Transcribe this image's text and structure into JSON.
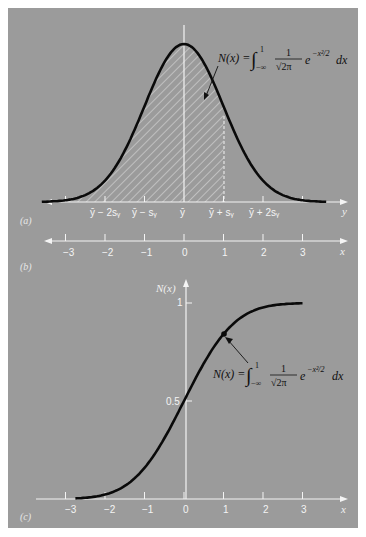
{
  "figure": {
    "background_color": "#9b9b9b",
    "curve_color": "#0a0a0a",
    "axis_color": "#f4f4f4"
  },
  "panels": {
    "a": {
      "label": "(a)",
      "axis_name": "y",
      "tick_labels": [
        "ȳ − 2sᵧ",
        "ȳ − sᵧ",
        "ȳ",
        "ȳ + sᵧ",
        "ȳ + 2sᵧ"
      ],
      "formula": {
        "lhs": "N(x) =",
        "integral": "∫",
        "upper": "1",
        "lower": "−∞",
        "numerator": "1",
        "denominator": "√2π",
        "exp": "e",
        "exp_power": "−x²/2",
        "dx": "dx"
      }
    },
    "b": {
      "label": "(b)",
      "axis_name": "x",
      "tick_labels": [
        "−3",
        "−2",
        "−1",
        "0",
        "1",
        "2",
        "3"
      ]
    },
    "c": {
      "label": "(c)",
      "axis_name": "x",
      "y_axis_name": "N(x)",
      "x_tick_labels": [
        "−3",
        "−2",
        "−1",
        "0",
        "1",
        "2",
        "3"
      ],
      "y_tick_labels": [
        "0.5",
        "1"
      ],
      "formula": {
        "lhs": "N(x) =",
        "integral": "∫",
        "upper": "1",
        "lower": "−∞",
        "numerator": "1",
        "denominator": "√2π",
        "exp": "e",
        "exp_power": "−x²/2",
        "dx": "dx"
      }
    }
  },
  "chart_data": [
    {
      "type": "area",
      "title": "(a) Normal probability density with shaded cumulative area",
      "xlabel": "y",
      "ylabel": "",
      "x_tick_labels": [
        "ȳ − 2sᵧ",
        "ȳ − sᵧ",
        "ȳ",
        "ȳ + sᵧ",
        "ȳ + 2sᵧ"
      ],
      "xlim": [
        -3.0,
        3.6
      ],
      "shaded_region": {
        "from": "-inf",
        "to": 1,
        "pattern": "diagonal hatch"
      },
      "series": [
        {
          "name": "standard normal pdf",
          "x": [
            -3,
            -2.5,
            -2,
            -1.5,
            -1,
            -0.5,
            0,
            0.5,
            1,
            1.5,
            2,
            2.5,
            3
          ],
          "values": [
            0.004,
            0.018,
            0.054,
            0.13,
            0.242,
            0.352,
            0.399,
            0.352,
            0.242,
            0.13,
            0.054,
            0.018,
            0.004
          ]
        }
      ],
      "annotations": [
        "N(x) = ∫_{−∞}^{1} (1/√(2π)) e^{−x²/2} dx"
      ]
    },
    {
      "type": "line",
      "title": "(b) Standardized x axis",
      "xlabel": "x",
      "categories": [
        "−3",
        "−2",
        "−1",
        "0",
        "1",
        "2",
        "3"
      ],
      "xlim": [
        -3.0,
        3.6
      ]
    },
    {
      "type": "line",
      "title": "(c) Cumulative normal distribution N(x)",
      "xlabel": "x",
      "ylabel": "N(x)",
      "xlim": [
        -3.0,
        3.6
      ],
      "ylim": [
        0,
        1.1
      ],
      "y_ticks": [
        0.5,
        1
      ],
      "x_ticks": [
        -3,
        -2,
        -1,
        0,
        1,
        2,
        3
      ],
      "series": [
        {
          "name": "N(x)",
          "x": [
            -2.8,
            -2.5,
            -2,
            -1.5,
            -1,
            -0.5,
            0,
            0.5,
            1,
            1.5,
            2,
            2.5,
            3
          ],
          "values": [
            0.003,
            0.006,
            0.023,
            0.067,
            0.159,
            0.309,
            0.5,
            0.691,
            0.841,
            0.933,
            0.977,
            0.994,
            0.999
          ]
        }
      ],
      "highlight_point": {
        "x": 1,
        "y": 0.841
      },
      "annotations": [
        "N(x) = ∫_{−∞}^{1} (1/√(2π)) e^{−x²/2} dx"
      ]
    }
  ]
}
